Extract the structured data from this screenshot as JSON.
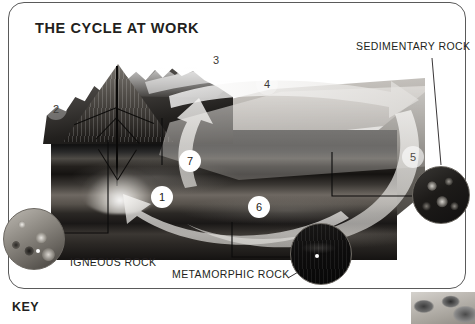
{
  "panel": {
    "title": "THE CYCLE AT WORK"
  },
  "key": {
    "label": "KEY"
  },
  "labels": [
    {
      "id": "sedimentary",
      "text": "SEDIMENTARY ROCK"
    },
    {
      "id": "igneous",
      "text": "IGNEOUS ROCK"
    },
    {
      "id": "metamorphic",
      "text": "METAMORPHIC ROCK"
    }
  ],
  "callouts": [
    {
      "id": "1",
      "number": "1",
      "style": "solid"
    },
    {
      "id": "2",
      "number": "2",
      "style": "faint"
    },
    {
      "id": "3",
      "number": "3",
      "style": "faint"
    },
    {
      "id": "4",
      "number": "4",
      "style": "faint"
    },
    {
      "id": "5",
      "number": "5",
      "style": "ghost"
    },
    {
      "id": "6",
      "number": "6",
      "style": "solid"
    },
    {
      "id": "7",
      "number": "7",
      "style": "solid"
    }
  ],
  "insets": [
    {
      "id": "igneous-rock-inset",
      "caption": "IGNEOUS ROCK"
    },
    {
      "id": "sedimentary-rock-inset",
      "caption": "SEDIMENTARY ROCK"
    },
    {
      "id": "metamorphic-rock-inset",
      "caption": "METAMORPHIC ROCK"
    }
  ],
  "colors": {
    "text": "#231f20",
    "card_border": "#5a5a5a",
    "page_background": "#ffffff",
    "arrow": "#eceae7"
  }
}
